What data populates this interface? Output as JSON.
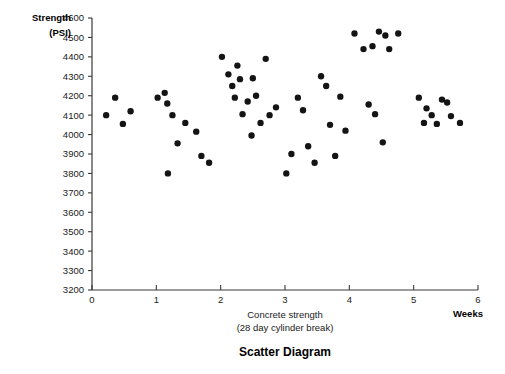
{
  "chart_data": {
    "type": "scatter",
    "title": "Scatter Diagram",
    "xlabel": "Concrete strength",
    "xlabel_line2": "(28 day cylinder break)",
    "xaxis_unit_label": "Weeks",
    "ylabel": "Strength",
    "ylabel_line2": "(PSI)",
    "xlim": [
      0,
      6
    ],
    "ylim": [
      3200,
      4600
    ],
    "xticks": [
      0,
      1,
      2,
      3,
      4,
      5,
      6
    ],
    "yticks": [
      3200,
      3300,
      3400,
      3500,
      3600,
      3700,
      3800,
      3900,
      4000,
      4100,
      4200,
      4300,
      4400,
      4500,
      4600
    ],
    "grid": false,
    "legend": null,
    "marker": {
      "shape": "circle",
      "color": "#141414",
      "size": 4.6
    },
    "points": [
      {
        "x": 0.22,
        "y": 4100
      },
      {
        "x": 0.36,
        "y": 4190
      },
      {
        "x": 0.48,
        "y": 4055
      },
      {
        "x": 0.6,
        "y": 4120
      },
      {
        "x": 1.02,
        "y": 4190
      },
      {
        "x": 1.13,
        "y": 4215
      },
      {
        "x": 1.17,
        "y": 4160
      },
      {
        "x": 1.25,
        "y": 4100
      },
      {
        "x": 1.33,
        "y": 3955
      },
      {
        "x": 1.45,
        "y": 4060
      },
      {
        "x": 1.18,
        "y": 3800
      },
      {
        "x": 1.62,
        "y": 4015
      },
      {
        "x": 1.7,
        "y": 3890
      },
      {
        "x": 1.82,
        "y": 3855
      },
      {
        "x": 2.02,
        "y": 4400
      },
      {
        "x": 2.12,
        "y": 4310
      },
      {
        "x": 2.18,
        "y": 4250
      },
      {
        "x": 2.26,
        "y": 4355
      },
      {
        "x": 2.3,
        "y": 4285
      },
      {
        "x": 2.22,
        "y": 4190
      },
      {
        "x": 2.34,
        "y": 4105
      },
      {
        "x": 2.42,
        "y": 4170
      },
      {
        "x": 2.5,
        "y": 4290
      },
      {
        "x": 2.55,
        "y": 4200
      },
      {
        "x": 2.62,
        "y": 4060
      },
      {
        "x": 2.7,
        "y": 4390
      },
      {
        "x": 2.76,
        "y": 4100
      },
      {
        "x": 2.48,
        "y": 3995
      },
      {
        "x": 2.86,
        "y": 4140
      },
      {
        "x": 3.02,
        "y": 3800
      },
      {
        "x": 3.1,
        "y": 3900
      },
      {
        "x": 3.2,
        "y": 4190
      },
      {
        "x": 3.28,
        "y": 4125
      },
      {
        "x": 3.36,
        "y": 3940
      },
      {
        "x": 3.46,
        "y": 3855
      },
      {
        "x": 3.56,
        "y": 4300
      },
      {
        "x": 3.64,
        "y": 4250
      },
      {
        "x": 3.7,
        "y": 4050
      },
      {
        "x": 3.78,
        "y": 3890
      },
      {
        "x": 3.86,
        "y": 4195
      },
      {
        "x": 3.94,
        "y": 4020
      },
      {
        "x": 4.08,
        "y": 4520
      },
      {
        "x": 4.22,
        "y": 4440
      },
      {
        "x": 4.36,
        "y": 4455
      },
      {
        "x": 4.46,
        "y": 4530
      },
      {
        "x": 4.56,
        "y": 4510
      },
      {
        "x": 4.62,
        "y": 4440
      },
      {
        "x": 4.76,
        "y": 4520
      },
      {
        "x": 4.3,
        "y": 4155
      },
      {
        "x": 4.4,
        "y": 4105
      },
      {
        "x": 4.52,
        "y": 3960
      },
      {
        "x": 5.08,
        "y": 4190
      },
      {
        "x": 5.2,
        "y": 4135
      },
      {
        "x": 5.28,
        "y": 4100
      },
      {
        "x": 5.16,
        "y": 4060
      },
      {
        "x": 5.36,
        "y": 4055
      },
      {
        "x": 5.44,
        "y": 4180
      },
      {
        "x": 5.52,
        "y": 4165
      },
      {
        "x": 5.58,
        "y": 4095
      },
      {
        "x": 5.72,
        "y": 4060
      }
    ]
  }
}
